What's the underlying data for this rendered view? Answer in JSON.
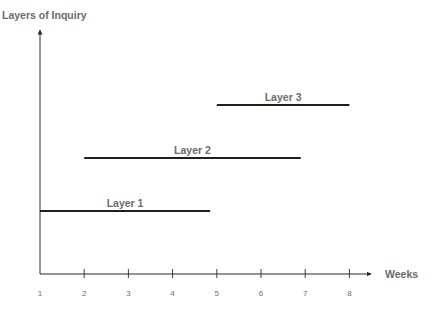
{
  "chart_data": {
    "type": "timeline",
    "title": "",
    "ylabel": "Layers of Inquiry",
    "xlabel": "Weeks",
    "x_ticks": [
      1,
      2,
      3,
      4,
      5,
      6,
      7,
      8
    ],
    "xlim": [
      1,
      8.5
    ],
    "grid": false,
    "legend": "none",
    "series": [
      {
        "name": "Layer 1",
        "start": 1,
        "end": 4.85,
        "level": 1
      },
      {
        "name": "Layer 2",
        "start": 2,
        "end": 6.9,
        "level": 2
      },
      {
        "name": "Layer 3",
        "start": 5,
        "end": 8,
        "level": 3
      }
    ]
  },
  "colors": {
    "line": "#1f1f1f",
    "axis": "#2a2a2a",
    "text": "#6b6b6b"
  }
}
